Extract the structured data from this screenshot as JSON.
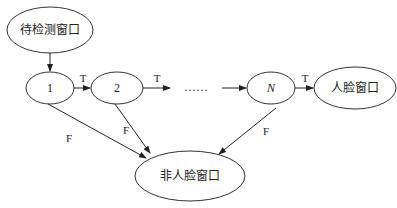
{
  "diagram": {
    "type": "cascade-classifier-flow",
    "nodes": [
      {
        "id": "input",
        "label": "待检测窗口"
      },
      {
        "id": "stage1",
        "label": "1"
      },
      {
        "id": "stage2",
        "label": "2"
      },
      {
        "id": "ellipsis",
        "label": "……"
      },
      {
        "id": "stageN",
        "label": "N"
      },
      {
        "id": "face",
        "label": "人脸窗口"
      },
      {
        "id": "nonface",
        "label": "非人脸窗口"
      }
    ],
    "edges": [
      {
        "from": "input",
        "to": "stage1",
        "label": ""
      },
      {
        "from": "stage1",
        "to": "stage2",
        "label": "T"
      },
      {
        "from": "stage2",
        "to": "ellipsis",
        "label": "T"
      },
      {
        "from": "ellipsis",
        "to": "stageN",
        "label": ""
      },
      {
        "from": "stageN",
        "to": "face",
        "label": "T"
      },
      {
        "from": "stage1",
        "to": "nonface",
        "label": "F"
      },
      {
        "from": "stage2",
        "to": "nonface",
        "label": "F"
      },
      {
        "from": "stageN",
        "to": "nonface",
        "label": "F"
      }
    ]
  }
}
